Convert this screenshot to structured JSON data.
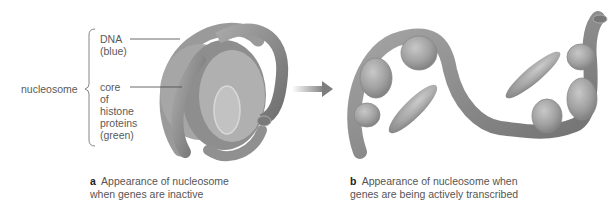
{
  "figure": {
    "panel_a": {
      "letter": "a",
      "caption_line1": "Appearance of nucleosome",
      "caption_line2": "when genes are inactive",
      "group_label": "nucleosome",
      "labels": [
        {
          "lines": [
            "DNA",
            "(blue)"
          ]
        },
        {
          "lines": [
            "core",
            "of",
            "histone",
            "proteins",
            "(green)"
          ]
        }
      ]
    },
    "panel_b": {
      "letter": "b",
      "caption_line1": "Appearance of nucleosome when",
      "caption_line2": "genes are being actively transcribed"
    },
    "arrow": "transition-arrow",
    "colors": {
      "dna": "#8f8f8f",
      "dna_dark": "#6f6f6f",
      "histone": "#a9a9a9",
      "arrow": "#8a8a8a",
      "text": "#555555"
    }
  }
}
